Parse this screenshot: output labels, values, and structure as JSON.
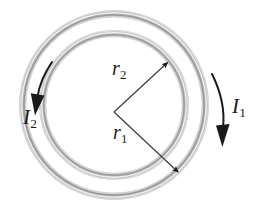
{
  "figure": {
    "background_color": "#ffffff",
    "ring_color_dark": "#9a9a9a",
    "ring_color_light": "#e8e8e8",
    "ring_color_mid": "#bdbdbd",
    "arrow_color": "#1a1a1a",
    "radius_line_color": "#3a3a3a",
    "center": {
      "x": 114,
      "y": 105
    },
    "rings": [
      {
        "name": "outer-ring",
        "radius": 91,
        "tube_thickness": 6,
        "current_label": "I1"
      },
      {
        "name": "inner-ring",
        "radius": 71,
        "tube_thickness": 6,
        "current_label": "I2"
      }
    ]
  },
  "labels": {
    "r2": {
      "symbol": "r",
      "subscript": "2",
      "meaning": "inner loop radius"
    },
    "r1": {
      "symbol": "r",
      "subscript": "1",
      "meaning": "outer loop radius"
    },
    "I1": {
      "symbol": "I",
      "subscript": "1",
      "meaning": "current in outer loop",
      "direction": "clockwise-downward-right"
    },
    "I2": {
      "symbol": "I",
      "subscript": "2",
      "meaning": "current in inner/outer left loop",
      "direction": "clockwise-downward-left"
    }
  },
  "radius_arrows": [
    {
      "name": "r2-arrow",
      "from": {
        "x": 114,
        "y": 112
      },
      "to": {
        "x": 170,
        "y": 60
      },
      "label": "r2"
    },
    {
      "name": "r1-arrow",
      "from": {
        "x": 114,
        "y": 112
      },
      "to": {
        "x": 181,
        "y": 175
      },
      "label": "r1"
    }
  ],
  "current_arrows": [
    {
      "name": "I1-current-arrow",
      "label": "I1",
      "path": "M 213 76 C 221 96 224 112 222 129",
      "head_at": {
        "x": 222,
        "y": 136
      },
      "head_angle_deg": 96
    },
    {
      "name": "I2-current-arrow",
      "label": "I2",
      "path": "M 51 63 C 43 76 38 88 37 99",
      "head_at": {
        "x": 36,
        "y": 107
      },
      "head_angle_deg": 100
    }
  ]
}
